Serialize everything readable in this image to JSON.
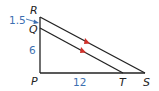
{
  "figure": {
    "type": "triangle proportionality diagram",
    "vertices": {
      "R": {
        "label": "R"
      },
      "Q": {
        "label": "Q"
      },
      "P": {
        "label": "P"
      },
      "T": {
        "label": "T"
      },
      "S": {
        "label": "S"
      }
    },
    "measurements": {
      "RQ": "1.5",
      "QP": "6",
      "PT": "12"
    },
    "parallel_segments": [
      "QT",
      "RS"
    ],
    "colors": {
      "lines": "#222222",
      "measurement_text": "#3d6fb0",
      "parallel_marks": "#d0302a"
    }
  }
}
